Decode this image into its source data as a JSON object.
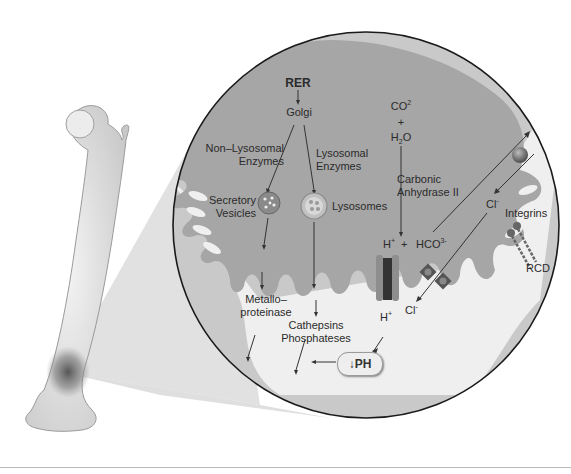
{
  "figure": {
    "colors": {
      "background": "#ffffff",
      "cell_cytoplasm": "#a8a8a8",
      "circle_fill": "#c9c9c9",
      "bone_matrix": "#c4c4c4",
      "resorption_space": "#f2f2f2",
      "outline": "#1a1a1a",
      "text": "#2b2b2b",
      "zoom_wedge": "#dcdcdc"
    }
  },
  "labels": {
    "rer": "RER",
    "golgi": "Golgi",
    "non_lysosomal_line1": "Non–Lysosomal",
    "non_lysosomal_line2": "Enzymes",
    "lysosomal_line1": "Lysosomal",
    "lysosomal_line2": "Enzymes",
    "secretory_line1": "Secretory",
    "secretory_line2": "Vesicles",
    "lysosomes": "Lysosomes",
    "metallo_line1": "Metallo–",
    "metallo_line2": "proteinase",
    "cathepsins": "Cathepsins",
    "phosphateses": "Phosphateses",
    "co2_base": "CO",
    "co2_sup": "2",
    "plus": "+",
    "h2o_h": "H",
    "h2o_sub": "2",
    "h2o_o": "O",
    "carbonic_line1": "Carbonic",
    "carbonic_line2": "Anhydrase II",
    "h_plus_base": "H",
    "h_plus_sup": "+",
    "plus2": "+",
    "hco3_base": "HCO",
    "hco3_sup": "3-",
    "cl_upper_base": "Cl",
    "cl_upper_sup": "-",
    "cl_lower_base": "Cl",
    "cl_lower_sup": "-",
    "h_lower_base": "H",
    "h_lower_sup": "+",
    "integrins": "Integrins",
    "rcd": "RCD",
    "ph_badge": "↓PH"
  }
}
